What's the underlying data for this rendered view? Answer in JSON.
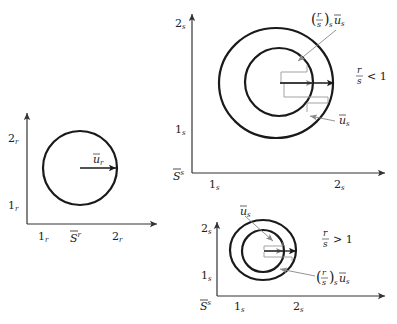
{
  "panels": {
    "left": {
      "y_tick_2": "2",
      "y_tick_2_sub": "r",
      "y_tick_1": "1",
      "y_tick_1_sub": "r",
      "x_tick_1": "1",
      "x_tick_1_sub": "r",
      "x_tick_2": "2",
      "x_tick_2_sub": "r",
      "origin_label": "S",
      "origin_sup": "r",
      "vector_label": "u",
      "vector_sub": "r"
    },
    "top_right": {
      "y_tick_2": "2",
      "y_tick_2_sub": "s",
      "y_tick_1": "1",
      "y_tick_1_sub": "s",
      "x_tick_1": "1",
      "x_tick_1_sub": "s",
      "x_tick_2": "2",
      "x_tick_2_sub": "s",
      "origin_label": "S",
      "origin_sup": "s",
      "condition_num": "r",
      "condition_den": "s",
      "condition_op": "< 1",
      "scaled_vector_label": {
        "paren_open": "(",
        "num": "r",
        "den": "s",
        "paren_close": ")",
        "paren_sub": "s",
        "vec": "u",
        "vec_sub": "s"
      },
      "vector_label": "u",
      "vector_sub": "s"
    },
    "bottom_right": {
      "y_tick_2": "2",
      "y_tick_2_sub": "s",
      "y_tick_1": "1",
      "y_tick_1_sub": "s",
      "x_tick_1": "1",
      "x_tick_1_sub": "s",
      "x_tick_2": "2",
      "x_tick_2_sub": "s",
      "origin_label": "S",
      "origin_sup": "s",
      "condition_num": "r",
      "condition_den": "s",
      "condition_op": "> 1",
      "scaled_vector_label": {
        "paren_open": "(",
        "num": "r",
        "den": "s",
        "paren_close": ")",
        "paren_sub": "s",
        "vec": "u",
        "vec_sub": "s"
      },
      "vector_label": "u",
      "vector_sub": "s"
    }
  },
  "colors": {
    "ink": "#1a1a1a",
    "axis": "#333333",
    "gray": "#888888"
  }
}
